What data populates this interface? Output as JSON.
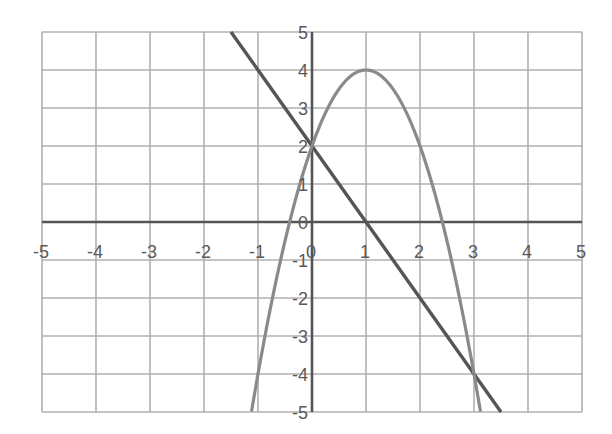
{
  "chart_data": {
    "type": "line",
    "title": "",
    "xlabel": "",
    "ylabel": "",
    "xlim": [
      -5,
      5
    ],
    "ylim": [
      -5,
      5
    ],
    "grid": true,
    "legend": null,
    "x_ticks": [
      "-5",
      "-4",
      "-3",
      "-2",
      "-1",
      "0",
      "1",
      "2",
      "3",
      "4",
      "5"
    ],
    "y_ticks": [
      "5",
      "4",
      "3",
      "2",
      "1",
      "0",
      "-1",
      "-2",
      "-3",
      "-4",
      "-5"
    ],
    "series": [
      {
        "name": "line",
        "expression": "y = -2x + 2",
        "color": "#555555",
        "x": [
          -1.5,
          -1,
          0,
          1,
          2,
          3,
          3.5
        ],
        "y": [
          5,
          4,
          2,
          0,
          -2,
          -4,
          -5
        ]
      },
      {
        "name": "parabola",
        "expression": "y = -2x^2 + 4x + 2",
        "color": "#8a8a8a",
        "x": [
          -1.12,
          -1,
          -0.5,
          0,
          0.5,
          1,
          1.5,
          2,
          2.5,
          3,
          3.12
        ],
        "y": [
          -5,
          -4,
          0.5,
          2,
          3.5,
          4,
          3.5,
          2,
          -0.5,
          -4,
          -5
        ]
      }
    ],
    "intersections": [
      {
        "x": 0,
        "y": 2
      },
      {
        "x": 3,
        "y": -4
      }
    ]
  },
  "colors": {
    "grid": "#b0b0b0",
    "axes": "#555555",
    "labels": "#5a5a5a",
    "background": "#ffffff"
  }
}
